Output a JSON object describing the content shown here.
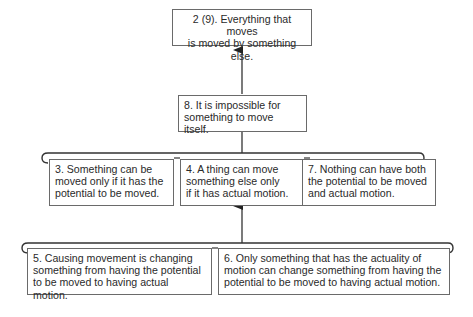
{
  "diagram": {
    "type": "argument-map",
    "colors": {
      "line": "#3a3a3a",
      "border": "#6a6a6a",
      "text": "#2a2a2a",
      "background": "#ffffff"
    },
    "nodes": {
      "conclusion": {
        "line1": "2 (9). Everything that moves",
        "line2": "is moved by something else."
      },
      "intermediate": {
        "line1": "8. It is impossible for",
        "line2": "something to move itself."
      },
      "premise3": {
        "line1": "3. Something can be",
        "line2": "moved only if it has the",
        "line3": "potential to be moved."
      },
      "premise4": {
        "line1": "4. A thing can move",
        "line2": "something else only",
        "line3": "if it has actual motion."
      },
      "premise7": {
        "line1": "7. Nothing can have both",
        "line2": "the potential to be moved",
        "line3": "and actual motion."
      },
      "premise5": {
        "line1": "5. Causing movement is changing",
        "line2": "something from having the potential",
        "line3": "to be moved to having actual motion."
      },
      "premise6": {
        "line1": "6. Only something that has the actuality of",
        "line2": "motion can change something from having the",
        "line3": "potential to be moved to having actual motion."
      }
    },
    "edges": [
      {
        "from": "premise5+premise6",
        "to": "premise4"
      },
      {
        "from": "premise3+premise4+premise7",
        "to": "intermediate"
      },
      {
        "from": "intermediate",
        "to": "conclusion"
      }
    ]
  }
}
